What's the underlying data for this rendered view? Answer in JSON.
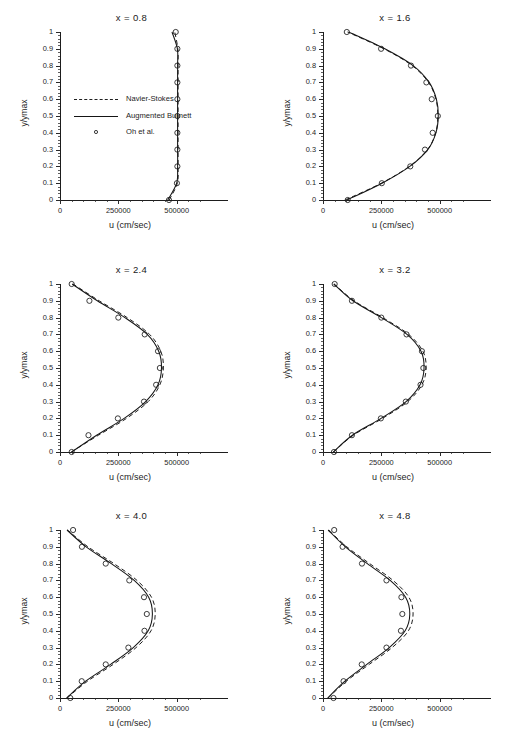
{
  "figure": {
    "xlabel": "u (cm/sec)",
    "ylabel": "y/ymax",
    "xticks": [
      "0",
      "250000",
      "500000"
    ],
    "xtick_values": [
      0,
      250000,
      500000
    ],
    "yticks": [
      "0",
      "0.1",
      "0.2",
      "0.3",
      "0.4",
      "0.5",
      "0.6",
      "0.7",
      "0.8",
      "0.9",
      "1"
    ],
    "ytick_values": [
      0,
      0.1,
      0.2,
      0.3,
      0.4,
      0.5,
      0.6,
      0.7,
      0.8,
      0.9,
      1
    ],
    "xlim": [
      0,
      600000
    ],
    "ylim": [
      0,
      1
    ],
    "footer_partial_text": "a partially cropped caption line"
  },
  "legend": {
    "position": "inside-panel-1-left",
    "items": [
      {
        "label": "Navier-Stokes",
        "style": "dashed"
      },
      {
        "label": "Augmented Burnett",
        "style": "solid"
      },
      {
        "label": "Oh et al.",
        "style": "circle"
      }
    ]
  },
  "chart_data": [
    {
      "type": "line",
      "title": "x = 0.8",
      "xlabel": "u (cm/sec)",
      "ylabel": "y/ymax",
      "xlim": [
        0,
        600000
      ],
      "ylim": [
        0,
        1
      ],
      "grid": false,
      "y": [
        0,
        0.1,
        0.2,
        0.3,
        0.4,
        0.5,
        0.6,
        0.7,
        0.8,
        0.9,
        1.0
      ],
      "series": [
        {
          "name": "Navier-Stokes",
          "style": "dashed",
          "u": [
            468000,
            503000,
            506000,
            506000,
            506000,
            506000,
            506000,
            506000,
            506000,
            505000,
            492000
          ]
        },
        {
          "name": "Augmented Burnett",
          "style": "solid",
          "u": [
            462000,
            500000,
            504000,
            504000,
            504000,
            504000,
            504000,
            504000,
            504000,
            503000,
            480000
          ]
        },
        {
          "name": "Oh et al.",
          "style": "circle",
          "u": [
            467000,
            501000,
            503000,
            503000,
            503000,
            503000,
            503000,
            503000,
            503000,
            503000,
            496000
          ]
        }
      ]
    },
    {
      "type": "line",
      "title": "x = 1.6",
      "xlabel": "u (cm/sec)",
      "ylabel": "y/ymax",
      "xlim": [
        0,
        600000
      ],
      "ylim": [
        0,
        1
      ],
      "grid": false,
      "y": [
        0,
        0.1,
        0.2,
        0.3,
        0.4,
        0.5,
        0.6,
        0.7,
        0.8,
        0.9,
        1.0
      ],
      "series": [
        {
          "name": "Navier-Stokes",
          "style": "dashed",
          "u": [
            95000,
            250000,
            370000,
            448000,
            483000,
            492000,
            484000,
            452000,
            382000,
            261000,
            105000
          ]
        },
        {
          "name": "Augmented Burnett",
          "style": "solid",
          "u": [
            103000,
            253000,
            372000,
            449000,
            484000,
            494000,
            486000,
            455000,
            386000,
            265000,
            110000
          ]
        },
        {
          "name": "Oh et al.",
          "style": "circle",
          "u": [
            106000,
            252000,
            374000,
            437000,
            470000,
            492000,
            466000,
            443000,
            377000,
            249000,
            102000
          ]
        }
      ]
    },
    {
      "type": "line",
      "title": "x = 2.4",
      "xlabel": "u (cm/sec)",
      "ylabel": "y/ymax",
      "xlim": [
        0,
        600000
      ],
      "ylim": [
        0,
        1
      ],
      "grid": false,
      "y": [
        0,
        0.1,
        0.2,
        0.3,
        0.4,
        0.5,
        0.6,
        0.7,
        0.8,
        0.9,
        1.0
      ],
      "series": [
        {
          "name": "Navier-Stokes",
          "style": "dashed",
          "u": [
            48000,
            165000,
            285000,
            378000,
            428000,
            443000,
            432000,
            384000,
            288000,
            168000,
            56000
          ]
        },
        {
          "name": "Augmented Burnett",
          "style": "solid",
          "u": [
            50000,
            157000,
            275000,
            367000,
            420000,
            435000,
            423000,
            374000,
            278000,
            160000,
            52000
          ]
        },
        {
          "name": "Oh et al.",
          "style": "circle",
          "u": [
            50000,
            122000,
            248000,
            360000,
            412000,
            428000,
            420000,
            363000,
            250000,
            126000,
            50000
          ]
        }
      ]
    },
    {
      "type": "line",
      "title": "x = 3.2",
      "xlabel": "u (cm/sec)",
      "ylabel": "y/ymax",
      "xlim": [
        0,
        600000
      ],
      "ylim": [
        0,
        1
      ],
      "grid": false,
      "y": [
        0,
        0.1,
        0.2,
        0.3,
        0.4,
        0.5,
        0.6,
        0.7,
        0.8,
        0.9,
        1.0
      ],
      "series": [
        {
          "name": "Navier-Stokes",
          "style": "dashed",
          "u": [
            45000,
            130000,
            255000,
            363000,
            424000,
            442000,
            428000,
            367000,
            256000,
            133000,
            48000
          ]
        },
        {
          "name": "Augmented Burnett",
          "style": "solid",
          "u": [
            44000,
            126000,
            249000,
            356000,
            416000,
            433000,
            420000,
            360000,
            250000,
            128000,
            46000
          ]
        },
        {
          "name": "Oh et al.",
          "style": "circle",
          "u": [
            47000,
            124000,
            248000,
            355000,
            418000,
            430000,
            424000,
            358000,
            250000,
            124000,
            50000
          ]
        }
      ]
    },
    {
      "type": "line",
      "title": "x = 4.0",
      "xlabel": "u (cm/sec)",
      "ylabel": "y/ymax",
      "xlim": [
        0,
        600000
      ],
      "ylim": [
        0,
        1
      ],
      "grid": false,
      "y": [
        0,
        0.1,
        0.2,
        0.3,
        0.4,
        0.5,
        0.6,
        0.7,
        0.8,
        0.9,
        1.0
      ],
      "series": [
        {
          "name": "Navier-Stokes",
          "style": "dashed",
          "u": [
            30000,
            118000,
            228000,
            326000,
            390000,
            408000,
            392000,
            330000,
            231000,
            120000,
            32000
          ]
        },
        {
          "name": "Augmented Burnett",
          "style": "solid",
          "u": [
            28000,
            110000,
            217000,
            314000,
            378000,
            396000,
            380000,
            318000,
            220000,
            112000,
            30000
          ]
        },
        {
          "name": "Oh et al.",
          "style": "circle",
          "u": [
            44000,
            93000,
            196000,
            293000,
            362000,
            372000,
            360000,
            297000,
            196000,
            94000,
            56000
          ]
        }
      ]
    },
    {
      "type": "line",
      "title": "x = 4.8",
      "xlabel": "u (cm/sec)",
      "ylabel": "y/ymax",
      "xlim": [
        0,
        600000
      ],
      "ylim": [
        0,
        1
      ],
      "grid": false,
      "y": [
        0,
        0.1,
        0.2,
        0.3,
        0.4,
        0.5,
        0.6,
        0.7,
        0.8,
        0.9,
        1.0
      ],
      "series": [
        {
          "name": "Navier-Stokes",
          "style": "dashed",
          "u": [
            22000,
            100000,
            198000,
            296000,
            366000,
            386000,
            368000,
            300000,
            200000,
            102000,
            24000
          ]
        },
        {
          "name": "Augmented Burnett",
          "style": "solid",
          "u": [
            20000,
            94000,
            188000,
            284000,
            352000,
            372000,
            354000,
            288000,
            190000,
            96000,
            22000
          ]
        },
        {
          "name": "Oh et al.",
          "style": "circle",
          "u": [
            45000,
            88000,
            166000,
            272000,
            334000,
            340000,
            336000,
            272000,
            167000,
            84000,
            48000
          ]
        }
      ]
    }
  ]
}
